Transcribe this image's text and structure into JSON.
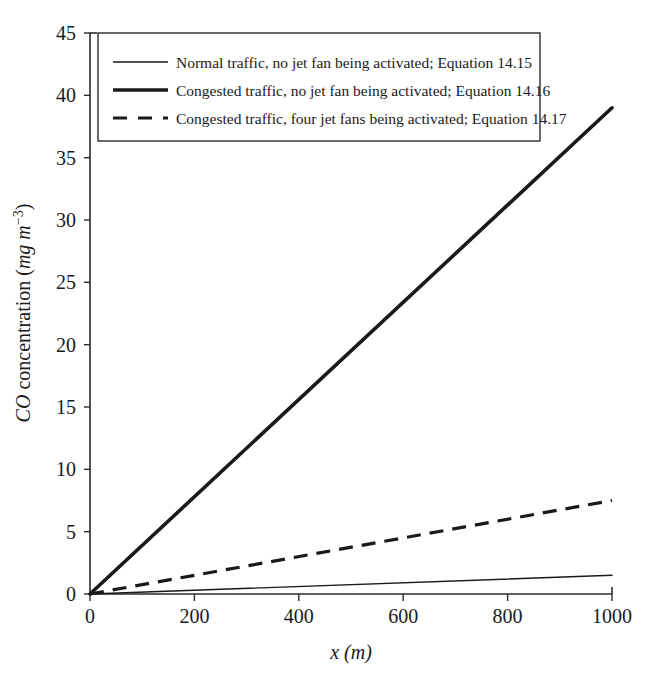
{
  "chart_data": {
    "type": "line",
    "title": "",
    "subtitle": "",
    "xlabel": "x (m)",
    "ylabel": "CO concentration (mg m^-3)",
    "xlabel_parts": {
      "var": "x",
      "unit": "(m)"
    },
    "ylabel_parts": {
      "lead": "CO",
      "mid": " concentration (",
      "unit_a": "mg",
      "unit_b": "m",
      "sup": "−3",
      "close": ")"
    },
    "xlim": [
      0,
      1000
    ],
    "ylim": [
      0,
      45
    ],
    "xticks": [
      0,
      200,
      400,
      600,
      800,
      1000
    ],
    "yticks": [
      0,
      5,
      10,
      15,
      20,
      25,
      30,
      35,
      40,
      45
    ],
    "xtick_labels": [
      "0",
      "200",
      "400",
      "600",
      "800",
      "1000"
    ],
    "ytick_labels": [
      "0",
      "5",
      "10",
      "15",
      "20",
      "25",
      "30",
      "35",
      "40",
      "45"
    ],
    "grid": false,
    "legend_position": "upper-left",
    "x": [
      0,
      1000
    ],
    "series": [
      {
        "name": "Normal traffic, no jet fan being activated; Equation 14.15",
        "style": "solid-thin",
        "color": "#1a1a1a",
        "linewidth": 1.4,
        "values": [
          0,
          1.5
        ]
      },
      {
        "name": "Congested traffic, no jet fan being activated; Equation 14.16",
        "style": "solid-thick",
        "color": "#1a1a1a",
        "linewidth": 3.6,
        "values": [
          0,
          39.0
        ]
      },
      {
        "name": "Congested traffic, four jet fans being activated; Equation 14.17",
        "style": "dashed",
        "color": "#1a1a1a",
        "linewidth": 3.2,
        "values": [
          0,
          7.5
        ]
      }
    ]
  },
  "legend": {
    "entries": [
      {
        "label": "Normal traffic, no jet fan being activated; Equation 14.15",
        "style": "solid-thin"
      },
      {
        "label": "Congested traffic, no jet fan being activated; Equation 14.16",
        "style": "solid-thick"
      },
      {
        "label": "Congested traffic, four jet fans being activated; Equation 14.17",
        "style": "dashed"
      }
    ]
  },
  "colors": {
    "ink": "#1a1a1a",
    "axis": "#2b2b2b",
    "background": "#ffffff"
  }
}
